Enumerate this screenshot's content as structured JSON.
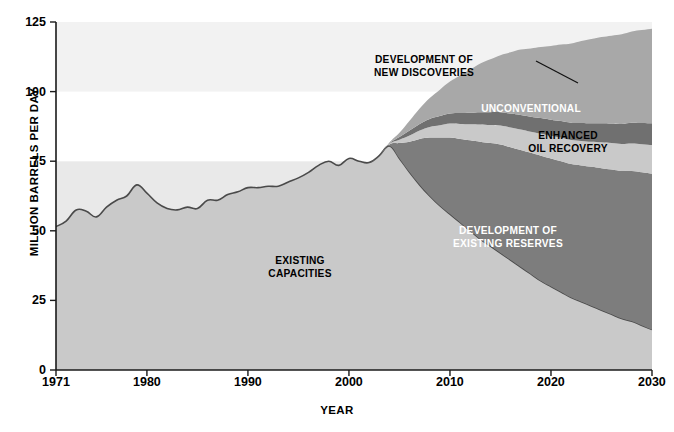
{
  "chart_data": {
    "type": "area",
    "title": "",
    "xlabel": "YEAR",
    "ylabel": "MILLION BARRELS PER DAY",
    "xlim": [
      1971,
      2030
    ],
    "ylim": [
      0,
      125
    ],
    "xticks": [
      1971,
      1980,
      1990,
      2000,
      2010,
      2020,
      2030
    ],
    "yticks": [
      0,
      25,
      50,
      75,
      100,
      125
    ],
    "grid": false,
    "legend_position": "inline-annotations",
    "stacked": true,
    "x": [
      1971,
      1972,
      1973,
      1974,
      1975,
      1976,
      1977,
      1978,
      1979,
      1980,
      1981,
      1982,
      1983,
      1984,
      1985,
      1986,
      1987,
      1988,
      1989,
      1990,
      1991,
      1992,
      1993,
      1994,
      1995,
      1996,
      1997,
      1998,
      1999,
      2000,
      2001,
      2002,
      2003,
      2004,
      2005,
      2006,
      2007,
      2008,
      2009,
      2010,
      2011,
      2012,
      2013,
      2014,
      2015,
      2016,
      2017,
      2018,
      2019,
      2020,
      2021,
      2022,
      2023,
      2024,
      2025,
      2026,
      2027,
      2028,
      2029,
      2030
    ],
    "series": [
      {
        "name": "EXISTING CAPACITIES",
        "color": "#c9c9c9",
        "label_color": "#000000",
        "values": [
          51.5,
          53.5,
          57.5,
          57.0,
          55.0,
          58.5,
          61.0,
          62.5,
          66.5,
          63.5,
          60.0,
          58.0,
          57.5,
          58.5,
          58.0,
          61.0,
          61.0,
          63.0,
          64.0,
          65.5,
          65.5,
          66.0,
          66.0,
          67.5,
          69.0,
          71.0,
          73.5,
          75.0,
          73.5,
          76.0,
          75.0,
          74.5,
          77.0,
          80.5,
          76.0,
          71.0,
          66.5,
          62.5,
          59.0,
          56.0,
          53.0,
          50.0,
          47.0,
          44.5,
          42.0,
          39.5,
          37.0,
          34.5,
          32.0,
          30.0,
          28.0,
          26.0,
          24.5,
          23.0,
          21.5,
          20.0,
          18.5,
          17.5,
          16.0,
          14.5
        ]
      },
      {
        "name": "DEVELOPMENT OF EXISTING RESERVES",
        "color": "#7d7d7d",
        "label_color": "#ffffff",
        "values": [
          0,
          0,
          0,
          0,
          0,
          0,
          0,
          0,
          0,
          0,
          0,
          0,
          0,
          0,
          0,
          0,
          0,
          0,
          0,
          0,
          0,
          0,
          0,
          0,
          0,
          0,
          0,
          0,
          0,
          0,
          0,
          0,
          0,
          0.5,
          5.5,
          11.0,
          16.5,
          21.0,
          24.5,
          27.5,
          30.0,
          32.5,
          35.0,
          37.0,
          39.0,
          40.5,
          42.0,
          43.5,
          45.0,
          46.0,
          47.0,
          48.0,
          49.0,
          50.0,
          51.0,
          52.0,
          53.0,
          54.0,
          55.0,
          56.0
        ]
      },
      {
        "name": "ENHANCED OIL RECOVERY",
        "color": "#c9c9c9",
        "label_color": "#000000",
        "values": [
          0,
          0,
          0,
          0,
          0,
          0,
          0,
          0,
          0,
          0,
          0,
          0,
          0,
          0,
          0,
          0,
          0,
          0,
          0,
          0,
          0,
          0,
          0,
          0,
          0,
          0,
          0,
          0,
          0,
          0,
          0,
          0,
          0,
          0.2,
          1.2,
          2.2,
          3.0,
          3.8,
          4.4,
          5.0,
          5.4,
          5.8,
          6.2,
          6.5,
          6.8,
          7.1,
          7.4,
          7.6,
          7.9,
          8.1,
          8.4,
          8.6,
          8.8,
          9.0,
          9.3,
          9.5,
          9.7,
          9.9,
          10.1,
          10.3
        ]
      },
      {
        "name": "UNCONVENTIONAL",
        "color": "#707070",
        "label_color": "#ffffff",
        "values": [
          0,
          0,
          0,
          0,
          0,
          0,
          0,
          0,
          0,
          0,
          0,
          0,
          0,
          0,
          0,
          0,
          0,
          0,
          0,
          0,
          0,
          0,
          0,
          0,
          0,
          0,
          0,
          0,
          0,
          0,
          0,
          0,
          0,
          0.2,
          1.0,
          1.8,
          2.4,
          2.9,
          3.3,
          3.6,
          3.9,
          4.1,
          4.4,
          4.6,
          4.8,
          5.0,
          5.2,
          5.4,
          5.6,
          5.8,
          6.0,
          6.2,
          6.4,
          6.6,
          6.8,
          7.0,
          7.2,
          7.4,
          7.6,
          7.8
        ]
      },
      {
        "name": "DEVELOPMENT OF NEW DISCOVERIES",
        "color": "#a8a8a8",
        "label_color": "#000000",
        "values": [
          0,
          0,
          0,
          0,
          0,
          0,
          0,
          0,
          0,
          0,
          0,
          0,
          0,
          0,
          0,
          0,
          0,
          0,
          0,
          0,
          0,
          0,
          0,
          0,
          0,
          0,
          0,
          0,
          0,
          0,
          0,
          0,
          0,
          0.3,
          1.5,
          3.5,
          5.5,
          7.5,
          9.5,
          11.5,
          13.5,
          15.5,
          17.5,
          19.0,
          20.5,
          22.0,
          23.5,
          24.5,
          25.5,
          26.5,
          27.5,
          28.5,
          29.5,
          30.3,
          31.0,
          31.6,
          32.2,
          32.8,
          33.4,
          34.0
        ]
      }
    ],
    "annotations": [
      {
        "name": "annotation-existing-capacities",
        "text": "EXISTING\nCAPACITIES",
        "x": 300,
        "y": 255,
        "tone": "dark"
      },
      {
        "name": "annotation-development-new-discoveries",
        "text": "DEVELOPMENT OF\nNEW DISCOVERIES",
        "x": 424,
        "y": 54,
        "tone": "dark"
      },
      {
        "name": "annotation-unconventional",
        "text": "UNCONVENTIONAL",
        "x": 531,
        "y": 103,
        "tone": "light"
      },
      {
        "name": "annotation-enhanced-oil-recovery",
        "text": "ENHANCED\nOIL RECOVERY",
        "x": 568,
        "y": 130,
        "tone": "dark"
      },
      {
        "name": "annotation-development-existing-reserves",
        "text": "DEVELOPMENT OF\nEXISTING RESERVES",
        "x": 508,
        "y": 225,
        "tone": "light"
      }
    ],
    "leader_line": {
      "x1": 536,
      "y1": 61,
      "x2": 578,
      "y2": 83
    },
    "background_bands": [
      {
        "from": 0,
        "to": 75,
        "color": "#e9e9e9"
      },
      {
        "from": 75,
        "to": 100,
        "color": "#ffffff"
      },
      {
        "from": 100,
        "to": 125,
        "color": "#f2f2f2"
      }
    ],
    "axis_color": "#1a1a1a"
  }
}
